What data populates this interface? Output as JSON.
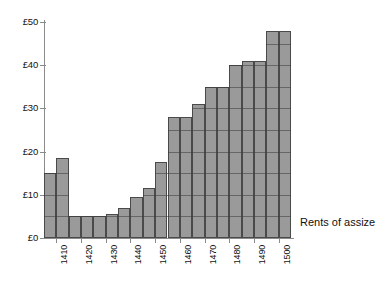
{
  "chart_data": {
    "type": "bar",
    "title": "",
    "subtitle": "",
    "xlabel": "",
    "ylabel": "",
    "series_label": "Rents of assize",
    "legend_position": "right-inside",
    "grid": true,
    "ylim": [
      0,
      50
    ],
    "y_ticks": [
      0,
      10,
      20,
      30,
      40,
      50
    ],
    "y_tick_labels": [
      "£0",
      "£10",
      "£20",
      "£30",
      "£40",
      "£50"
    ],
    "currency_symbol": "£",
    "xlim": [
      1405,
      1505
    ],
    "x_tick_values": [
      1410,
      1420,
      1430,
      1440,
      1450,
      1460,
      1470,
      1480,
      1490,
      1500
    ],
    "x_tick_labels": [
      "1410",
      "1420",
      "1430",
      "1440",
      "1450",
      "1460",
      "1470",
      "1480",
      "1490",
      "1500"
    ],
    "bar_width_years": 5,
    "categories": [
      "1405",
      "1410",
      "1415",
      "1420",
      "1425",
      "1430",
      "1435",
      "1440",
      "1445",
      "1450",
      "1455",
      "1460",
      "1465",
      "1470",
      "1475",
      "1480",
      "1485",
      "1490",
      "1495",
      "1500"
    ],
    "values": [
      15,
      18.5,
      5,
      5,
      5,
      5.5,
      7,
      9.5,
      11.5,
      17.5,
      28,
      28,
      31,
      35,
      35,
      40,
      41,
      41,
      48,
      48
    ],
    "colors": {
      "bar_fill": "#9a9a9a",
      "bar_edge": "#4a4a4a",
      "axis": "#8a8a8a",
      "text": "#111111",
      "background": "#ffffff"
    }
  }
}
